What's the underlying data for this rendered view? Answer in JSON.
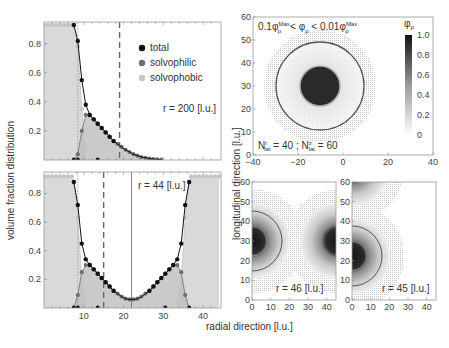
{
  "figure": {
    "y_label_left": "volume fraction distribution",
    "y_label_right": "longitudinal direction [l.u.]",
    "x_label": "radial direction [l.u.]"
  },
  "colors": {
    "total": "#111111",
    "solvophilic": "#6e6e6e",
    "solvophobic": "#c4c4c4",
    "fill_phobic": "#d9d9d9",
    "fill_philic": "#bdbdbd",
    "ring_outer": "#555555",
    "ring_inner": "#aaaaaa"
  },
  "chart_data": [
    {
      "id": "top-left",
      "type": "line",
      "annotation": "r = 200 [l.u.]",
      "legend": [
        "total",
        "solvophilic",
        "solvophobic"
      ],
      "xlim": [
        0,
        44.5
      ],
      "ylim": [
        0,
        0.95
      ],
      "yticks": [
        0.2,
        0.4,
        0.6,
        0.8
      ],
      "xticks": [],
      "dashed_lines_x": [
        8.5,
        19
      ],
      "series": [
        {
          "name": "total",
          "x": [
            7.5,
            8.5,
            9.5,
            10.5,
            11.5,
            12.5,
            13.5,
            14.5,
            15.5,
            16.5,
            17.5,
            18.5,
            19.5,
            20.5,
            21.5,
            22.5,
            23.5,
            24.5,
            25.5,
            26.5,
            27.5,
            28.5,
            29.5
          ],
          "y": [
            0.93,
            0.82,
            0.55,
            0.38,
            0.31,
            0.28,
            0.25,
            0.22,
            0.19,
            0.16,
            0.13,
            0.11,
            0.09,
            0.07,
            0.055,
            0.04,
            0.03,
            0.02,
            0.015,
            0.01,
            0.007,
            0.004,
            0.002
          ]
        },
        {
          "name": "solvophilic",
          "x": [
            7.5,
            8.5,
            9.5,
            10.5,
            11.5,
            12.5,
            13.5,
            14.5,
            15.5,
            16.5,
            17.5,
            18.5,
            19.5,
            20.5,
            21.5,
            22.5,
            23.5,
            24.5,
            25.5,
            26.5,
            27.5,
            28.5,
            29.5
          ],
          "y": [
            0.0,
            0.04,
            0.2,
            0.31,
            0.31,
            0.28,
            0.25,
            0.22,
            0.19,
            0.16,
            0.13,
            0.11,
            0.09,
            0.07,
            0.055,
            0.04,
            0.03,
            0.02,
            0.015,
            0.01,
            0.007,
            0.004,
            0.002
          ]
        },
        {
          "name": "solvophobic",
          "x": [
            0,
            1,
            2,
            3,
            4,
            5,
            6,
            7,
            7.5,
            8.5,
            9.5,
            10.5
          ],
          "y": [
            0.93,
            0.93,
            0.93,
            0.93,
            0.93,
            0.93,
            0.93,
            0.93,
            0.92,
            0.78,
            0.35,
            0.07
          ]
        }
      ]
    },
    {
      "id": "bottom-left",
      "type": "line",
      "annotation": "r = 44 [l.u.]",
      "xlim": [
        0,
        44.5
      ],
      "ylim": [
        0,
        0.95
      ],
      "yticks": [
        0.2,
        0.4,
        0.6,
        0.8
      ],
      "xticks": [
        10,
        20,
        30,
        40
      ],
      "dashed_lines_x": [
        8.5,
        15
      ],
      "solid_line_x": 22,
      "series": [
        {
          "name": "total",
          "x": [
            7.5,
            8.5,
            9.5,
            10.5,
            11.5,
            12.5,
            13.5,
            14.5,
            15.5,
            16.5,
            17.5,
            18.5,
            19.5,
            20.5,
            21.5,
            22.5,
            23.5,
            24.5,
            25.5,
            26.5,
            27.5,
            28.5,
            29.5,
            30.5,
            31.5,
            32.5,
            33.5,
            34.5,
            35.5,
            36.5
          ],
          "y": [
            0.88,
            0.72,
            0.45,
            0.34,
            0.3,
            0.27,
            0.24,
            0.21,
            0.18,
            0.15,
            0.12,
            0.1,
            0.08,
            0.065,
            0.06,
            0.06,
            0.065,
            0.08,
            0.1,
            0.12,
            0.15,
            0.18,
            0.21,
            0.24,
            0.27,
            0.3,
            0.34,
            0.45,
            0.72,
            0.88
          ]
        },
        {
          "name": "solvophilic",
          "x": [
            7.5,
            8.5,
            9.5,
            10.5,
            11.5,
            12.5,
            13.5,
            14.5,
            15.5,
            16.5,
            17.5,
            18.5,
            19.5,
            20.5,
            21.5,
            22.5,
            23.5,
            24.5,
            25.5,
            26.5,
            27.5,
            28.5,
            29.5,
            30.5,
            31.5,
            32.5,
            33.5,
            34.5,
            35.5,
            36.5
          ],
          "y": [
            0.0,
            0.09,
            0.25,
            0.3,
            0.3,
            0.27,
            0.24,
            0.21,
            0.18,
            0.15,
            0.12,
            0.1,
            0.08,
            0.065,
            0.06,
            0.06,
            0.065,
            0.08,
            0.1,
            0.12,
            0.15,
            0.18,
            0.21,
            0.24,
            0.27,
            0.3,
            0.3,
            0.25,
            0.09,
            0.0
          ]
        },
        {
          "name": "solvophobic",
          "x": [
            0,
            1,
            2,
            3,
            4,
            5,
            6,
            7,
            7.5,
            8.5,
            9.5,
            10.5,
            33.5,
            34.5,
            35.5,
            36.5,
            37,
            38,
            39,
            40,
            41,
            42,
            43,
            44
          ],
          "y": [
            0.92,
            0.92,
            0.92,
            0.92,
            0.92,
            0.92,
            0.92,
            0.92,
            0.88,
            0.63,
            0.2,
            0.04,
            0.04,
            0.2,
            0.63,
            0.88,
            0.92,
            0.92,
            0.92,
            0.92,
            0.92,
            0.92,
            0.92,
            0.92
          ]
        }
      ]
    },
    {
      "id": "top-right",
      "type": "heatmap",
      "title": "0.1φ_p^Max < φ_p < 0.01φ_p^Max",
      "annotation": "N_lat^r = 40 ; N_lat^z = 60",
      "xlim": [
        -40,
        40
      ],
      "ylim": [
        0,
        60
      ],
      "xticks": [
        -40,
        -20,
        0,
        20,
        40
      ],
      "yticks": [
        0,
        10,
        20,
        30,
        40,
        50,
        60
      ],
      "colorbar": {
        "label": "φ_p",
        "ticks": [
          0,
          0.2,
          0.4,
          0.6,
          0.8,
          1.0
        ],
        "range": [
          0,
          1.0
        ]
      },
      "core": {
        "cx": 0,
        "cy": 30,
        "r": 8.5
      },
      "ring_inner_r": 9,
      "ring_outer_r": 19.5,
      "halo_r": 25
    },
    {
      "id": "bottom-right-1",
      "type": "heatmap",
      "annotation": "r = 46 [l.u.]",
      "xlim": [
        0,
        45
      ],
      "ylim": [
        0,
        60
      ],
      "xticks": [
        0,
        10,
        20,
        30,
        40
      ],
      "yticks": [
        0,
        10,
        20,
        30,
        40,
        50,
        60
      ],
      "particles": [
        {
          "cx": 0,
          "cy": 30
        },
        {
          "cx": 46,
          "cy": 30
        }
      ]
    },
    {
      "id": "bottom-right-2",
      "type": "heatmap",
      "annotation": "r = 45 [l.u.]",
      "xlim": [
        0,
        45
      ],
      "ylim": [
        0,
        60
      ],
      "xticks": [
        0,
        10,
        20,
        30,
        40
      ],
      "yticks": [
        0,
        10,
        20,
        30,
        40,
        50,
        60
      ],
      "particles": [
        {
          "cx": 0,
          "cy": 22
        },
        {
          "cx": 0,
          "cy": 67
        }
      ]
    }
  ],
  "labels": {
    "legend_total": "total",
    "legend_solvophilic": "solvophilic",
    "legend_solvophobic": "solvophobic",
    "ann_r200": "r = 200 [l.u.]",
    "ann_r44": "r = 44 [l.u.]",
    "ann_r46": "r = 46 [l.u.]",
    "ann_r45": "r = 45 [l.u.]",
    "colorbar_label": "φ",
    "colorbar_sub": "p"
  }
}
